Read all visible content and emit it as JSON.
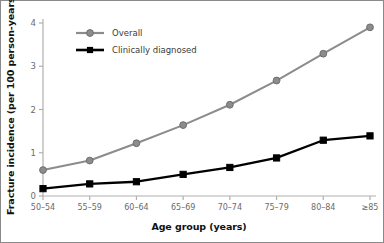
{
  "chart_data": {
    "type": "line",
    "title": "",
    "xlabel": "Age group (years)",
    "ylabel": "Fracture incidence (per 100 person-years)",
    "categories": [
      "50–54",
      "55–59",
      "60–64",
      "65–69",
      "70–74",
      "75–79",
      "80–84",
      "≥85"
    ],
    "yticks": [
      "0",
      "1",
      "2",
      "3",
      "4"
    ],
    "ylim": [
      0,
      4
    ],
    "grid": false,
    "legend_position": "top-left",
    "series": [
      {
        "name": "Overall",
        "color": "#8c8c8c",
        "marker": "circle",
        "values": [
          0.6,
          0.82,
          1.22,
          1.64,
          2.11,
          2.67,
          3.29,
          3.9
        ]
      },
      {
        "name": "Clinically diagnosed",
        "color": "#000000",
        "marker": "square",
        "values": [
          0.17,
          0.28,
          0.33,
          0.5,
          0.66,
          0.88,
          1.29,
          1.39
        ]
      }
    ]
  },
  "legend": {
    "items": [
      {
        "label": "Overall"
      },
      {
        "label": "Clinically diagnosed"
      }
    ]
  },
  "axes": {
    "x_title": "Age group (years)",
    "y_title": "Fracture incidence (per 100 person-years)"
  }
}
